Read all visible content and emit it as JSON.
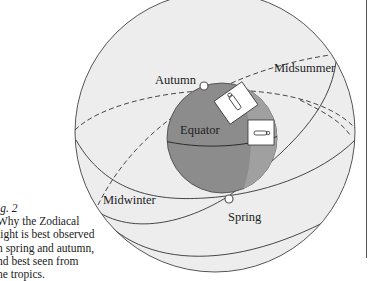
{
  "figure": {
    "labels": {
      "autumn": "Autumn",
      "midsummer": "Midsummer",
      "equator": "Equator",
      "midwinter": "Midwinter",
      "spring": "Spring"
    },
    "caption": {
      "number": "ig. 2",
      "lines": [
        "Why the Zodiacal",
        "light is best observed",
        "n spring and autumn,",
        "nd best seen from",
        "he tropics."
      ]
    },
    "colors": {
      "sphere_fill": "#ededed",
      "earth_fill": "#8c8c8c",
      "earth_shadow": "#a3a3a3",
      "line": "#333333"
    }
  }
}
